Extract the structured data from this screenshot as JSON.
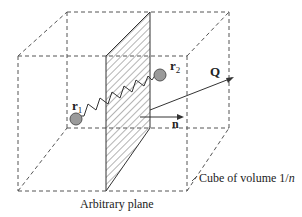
{
  "figure": {
    "labels": {
      "r1": "r",
      "r1_sub": "1",
      "r2": "r",
      "r2_sub": "2",
      "Q": "Q",
      "n": "n",
      "plane_caption": "Arbitrary plane",
      "cube_caption_prefix": "Cube of volume 1/",
      "cube_caption_var": "n"
    },
    "colors": {
      "line": "#333333",
      "bead_fill": "#9a9a9a",
      "bead_stroke": "#555555",
      "hatch": "#444444",
      "background": "#ffffff"
    }
  }
}
